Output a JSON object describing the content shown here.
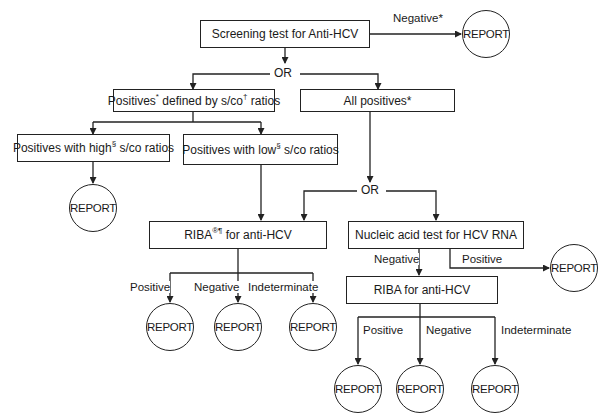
{
  "diagram": {
    "nodes": {
      "screening": {
        "text": "Screening test for Anti-HCV"
      },
      "negative_report": {
        "edge_label": "Negative*",
        "text": "REPORT"
      },
      "or_top": {
        "text": "OR"
      },
      "positives_sco": {
        "pre": "Positives",
        "sup1": "*",
        "mid": " defined by s/co",
        "sup2": "†",
        "post": " ratios"
      },
      "all_positives": {
        "text": "All positives*"
      },
      "high_sco": {
        "pre": "Positives with high",
        "sup": "§",
        "post": " s/co ratios"
      },
      "low_sco": {
        "pre": "Positives with low",
        "sup": "§",
        "post": " s/co ratios"
      },
      "high_report": {
        "text": "REPORT"
      },
      "or_mid": {
        "text": "OR"
      },
      "riba1": {
        "pre": "RIBA",
        "sup": "®¶",
        "post": " for anti-HCV"
      },
      "riba1_outcomes": [
        {
          "label": "Positive",
          "report": "REPORT"
        },
        {
          "label": "Negative",
          "report": "REPORT"
        },
        {
          "label": "Indeterminate",
          "report": "REPORT"
        }
      ],
      "nat": {
        "text": "Nucleic acid test for HCV RNA"
      },
      "nat_negative_label": "Negative",
      "nat_positive": {
        "label": "Positive",
        "report": "REPORT"
      },
      "riba2": {
        "text": "RIBA for anti-HCV"
      },
      "riba2_outcomes": [
        {
          "label": "Positive",
          "report": "REPORT"
        },
        {
          "label": "Negative",
          "report": "REPORT"
        },
        {
          "label": "Indeterminate",
          "report": "REPORT"
        }
      ]
    }
  }
}
